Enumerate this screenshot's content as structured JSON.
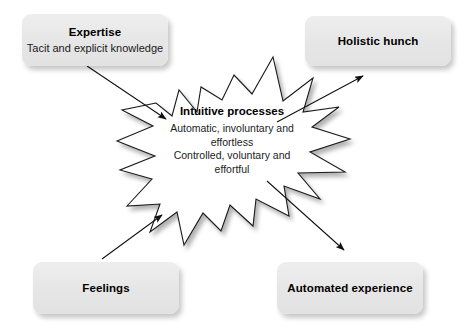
{
  "diagram": {
    "type": "concept-diagram",
    "background_color": "#ffffff",
    "box_fill_color": "#e8e8e8",
    "stroke_color": "#1a1a1a",
    "center": {
      "shape": "starburst",
      "title": "Intuitive processes",
      "lines": [
        "Automatic, involuntary and",
        "effortless",
        "Controlled, voluntary and",
        "effortful"
      ]
    },
    "nodes": [
      {
        "id": "expertise",
        "title": "Expertise",
        "subtitle": "Tacit and explicit knowledge",
        "position": "top-left",
        "role": "input"
      },
      {
        "id": "feelings",
        "title": "Feelings",
        "subtitle": "",
        "position": "bottom-left",
        "role": "input"
      },
      {
        "id": "holistic-hunch",
        "title": "Holistic hunch",
        "subtitle": "",
        "position": "top-right",
        "role": "output"
      },
      {
        "id": "automated-experience",
        "title": "Automated experience",
        "subtitle": "",
        "position": "bottom-right",
        "role": "output"
      }
    ],
    "arrows": [
      {
        "id": "expertise-to-center",
        "from": "expertise",
        "to": "center",
        "direction": "down-right"
      },
      {
        "id": "feelings-to-center",
        "from": "feelings",
        "to": "center",
        "direction": "up-right"
      },
      {
        "id": "center-to-holistic-hunch",
        "from": "center",
        "to": "holistic-hunch",
        "direction": "up-right"
      },
      {
        "id": "center-to-automated-experience",
        "from": "center",
        "to": "automated-experience",
        "direction": "down-right"
      }
    ]
  }
}
